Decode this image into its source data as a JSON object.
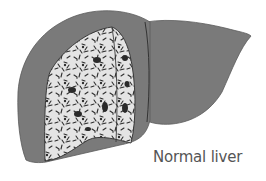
{
  "figure": {
    "caption": "Normal liver",
    "colors": {
      "liver_surface": "#7a7a7a",
      "cut_face": "#e4e4e4",
      "speckle": "#2e2e2e",
      "outline": "#3a3a3a",
      "caption_text": "#555555"
    }
  }
}
